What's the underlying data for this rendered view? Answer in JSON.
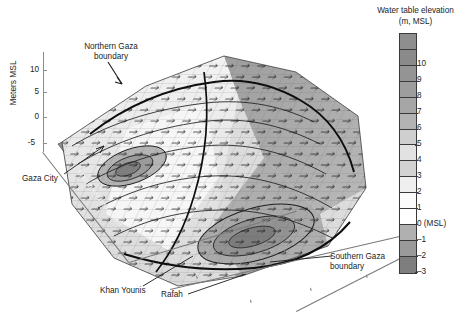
{
  "figure": {
    "type": "3d-surface",
    "axis": {
      "y_title": "Meters MSL",
      "y_ticks": [
        "10",
        "5",
        "0",
        "-5"
      ],
      "y_tick_values": [
        10,
        5,
        0,
        -5
      ]
    },
    "annotations": [
      {
        "id": "northern-gaza",
        "label_line1": "Northern Gaza",
        "label_line2": "boundary"
      },
      {
        "id": "gaza-city",
        "label": "Gaza City"
      },
      {
        "id": "mediterranean-sea",
        "label": "Mediterranean Sea"
      },
      {
        "id": "khan-younis",
        "label": "Khan Younis"
      },
      {
        "id": "rafah",
        "label": "Rafah"
      },
      {
        "id": "southern-gaza",
        "label_line1": "Southern Gaza",
        "label_line2": "boundary"
      }
    ]
  },
  "legend": {
    "title_line1": "Water table elevation",
    "title_line2": "(m, MSL)",
    "bands": [
      {
        "label": "",
        "color": "#8e8e8e"
      },
      {
        "label": "10",
        "color": "#8a8a8a"
      },
      {
        "label": "9",
        "color": "#949494"
      },
      {
        "label": "8",
        "color": "#9d9d9d"
      },
      {
        "label": "7",
        "color": "#a6a6a6"
      },
      {
        "label": "6",
        "color": "#b3b3b3"
      },
      {
        "label": "5",
        "color": "#cfcfcf"
      },
      {
        "label": "4",
        "color": "#e2e2e2"
      },
      {
        "label": "3",
        "color": "#d2d2d2"
      },
      {
        "label": "2",
        "color": "#efefef"
      },
      {
        "label": "1",
        "color": "#fbfbfb"
      },
      {
        "label": "0 (MSL)",
        "color": "#ffffff"
      },
      {
        "label": "-1",
        "color": "#b0b0b0"
      },
      {
        "label": "-2",
        "color": "#9a9a9a"
      },
      {
        "label": "-3",
        "color": "#7e7e7e"
      }
    ]
  },
  "chart_data": {
    "type": "surface",
    "title": "",
    "zlabel": "Meters MSL",
    "colorbar_label": "Water table elevation (m, MSL)",
    "zlim": [
      -5,
      10
    ],
    "colorbar_range": [
      -3,
      10
    ],
    "colorbar_ticks": [
      10,
      9,
      8,
      7,
      6,
      5,
      4,
      3,
      2,
      1,
      0,
      -1,
      -2,
      -3
    ],
    "features": [
      "Northern Gaza boundary",
      "Southern Gaza boundary",
      "Mediterranean Sea coastline",
      "Gaza City",
      "Khan Younis",
      "Rafah"
    ]
  }
}
